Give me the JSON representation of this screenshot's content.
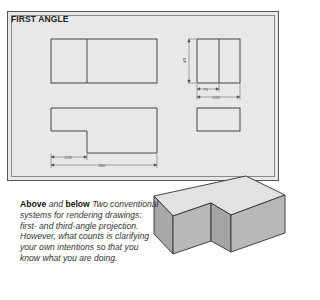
{
  "sheet": {
    "title": "FIRST ANGLE",
    "background": "#e8e8e8",
    "views": {
      "front_view": {
        "type": "rectangle with vertical divider"
      },
      "side_view": {
        "type": "rectangle with vertical divider",
        "dimensions": {
          "height": "40",
          "part_width": "75",
          "total_width": "150"
        }
      },
      "plan_view": {
        "type": "L-shape",
        "dimensions": {
          "step": "150",
          "total": "365"
        }
      },
      "side_plan_view": {
        "type": "rectangle"
      }
    }
  },
  "caption": {
    "lead_bold_1": "Above",
    "lead_and": " and ",
    "lead_bold_2": "below",
    "text": " Two conventional systems for rendering drawings: first- and third-angle projection. However, what counts is clarifying your own intentions so that you know what you are doing."
  },
  "isometric": {
    "description": "Isometric L-shaped block",
    "top_color": "#e0e0e0",
    "front_color": "#b3b3b3",
    "side_color": "#a0a0a0"
  }
}
